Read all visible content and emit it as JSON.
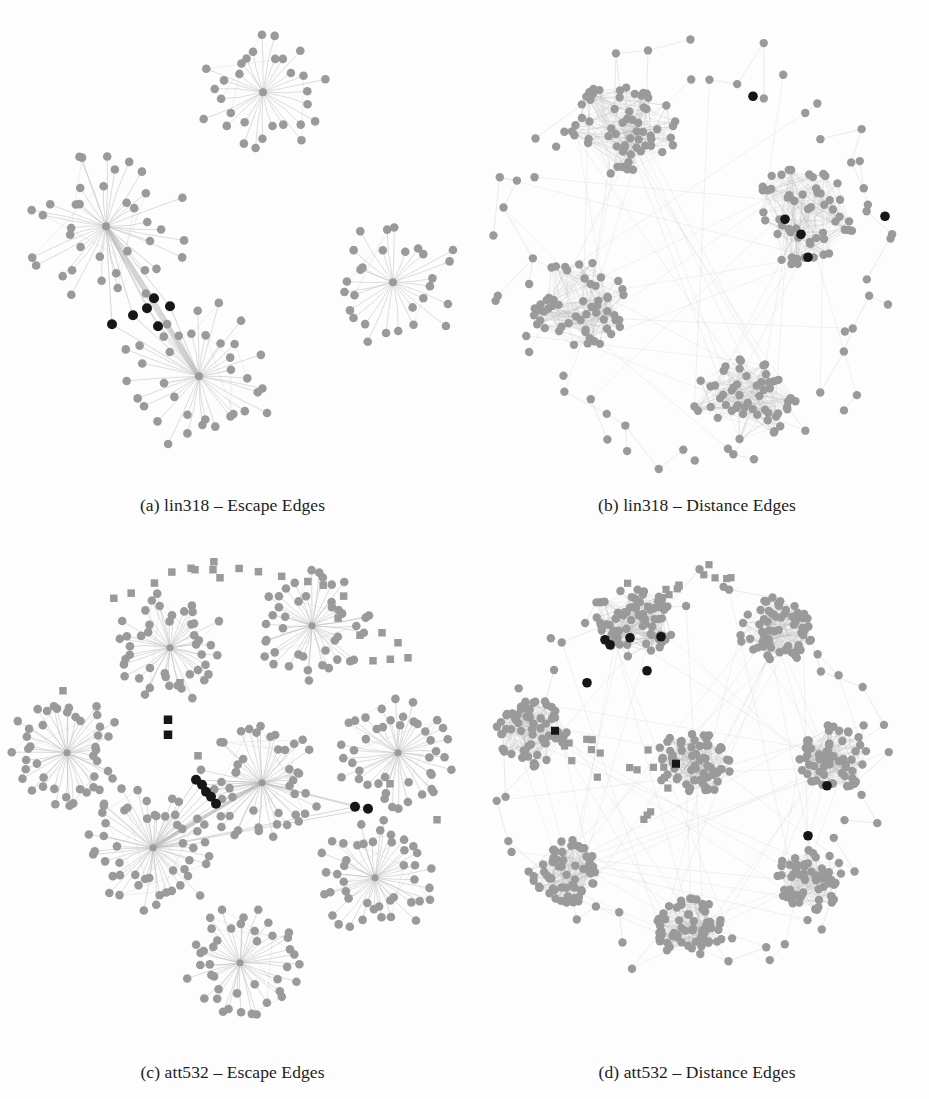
{
  "figure": {
    "background_color": "#fdfdfd",
    "node_color_gray": "#9a9a9a",
    "node_color_black": "#161616",
    "edge_color": "#b5b5b5",
    "caption_color": "#1c1c1c",
    "panel_count": 4
  },
  "panels": [
    {
      "id": "a",
      "caption": "(a) lin318 – Escape Edges",
      "instance": "lin318",
      "edge_type": "Escape Edges",
      "layout": "star-clusters",
      "cluster_count": 4,
      "gray_node_shape": "circle",
      "black_node_shape": "circle",
      "black_node_count": 6,
      "has_square_nodes": false
    },
    {
      "id": "b",
      "caption": "(b) lin318 – Distance Edges",
      "instance": "lin318",
      "edge_type": "Distance Edges",
      "layout": "blob-clusters",
      "cluster_count": 4,
      "gray_node_shape": "circle",
      "black_node_shape": "circle",
      "black_node_count": 5,
      "has_square_nodes": false
    },
    {
      "id": "c",
      "caption": "(c) att532 – Escape Edges",
      "instance": "att532",
      "edge_type": "Escape Edges",
      "layout": "star-clusters",
      "cluster_count": 8,
      "gray_node_shape": "circle",
      "black_node_shape": "circle",
      "black_node_count": 7,
      "has_square_nodes": true,
      "black_square_count": 2
    },
    {
      "id": "d",
      "caption": "(d) att532 – Distance Edges",
      "instance": "att532",
      "edge_type": "Distance Edges",
      "layout": "blob-clusters",
      "cluster_count": 8,
      "gray_node_shape": "circle",
      "black_node_shape": "circle",
      "black_node_count": 8,
      "has_square_nodes": true,
      "black_square_count": 2
    }
  ],
  "graph_spec": {
    "a": {
      "view": [
        0,
        0,
        465,
        488
      ],
      "seed": 17,
      "stars": [
        {
          "cx": 263,
          "cy": 88,
          "leaves": 30,
          "r1": 30,
          "r2": 70,
          "hubR": 4
        },
        {
          "cx": 106,
          "cy": 222,
          "leaves": 38,
          "r1": 32,
          "r2": 84,
          "hubR": 4
        },
        {
          "cx": 199,
          "cy": 372,
          "leaves": 36,
          "r1": 32,
          "r2": 80,
          "hubR": 4
        },
        {
          "cx": 393,
          "cy": 278,
          "leaves": 28,
          "r1": 30,
          "r2": 70,
          "hubR": 4
        }
      ],
      "bridge": {
        "from": 1,
        "to": 2
      },
      "black_nodes": [
        {
          "x": 154,
          "y": 294
        },
        {
          "x": 147,
          "y": 304
        },
        {
          "x": 170,
          "y": 302
        },
        {
          "x": 133,
          "y": 311
        },
        {
          "x": 112,
          "y": 320
        },
        {
          "x": 158,
          "y": 322
        }
      ],
      "squares": [],
      "black_squares": []
    },
    "b": {
      "view": [
        0,
        0,
        464,
        488
      ],
      "seed": 43,
      "blobs": [
        {
          "cx": 160,
          "cy": 122,
          "n": 58,
          "rx": 54,
          "ry": 50
        },
        {
          "cx": 340,
          "cy": 210,
          "n": 56,
          "rx": 50,
          "ry": 52
        },
        {
          "cx": 112,
          "cy": 300,
          "n": 54,
          "rx": 50,
          "ry": 46
        },
        {
          "cx": 280,
          "cy": 395,
          "n": 52,
          "rx": 52,
          "ry": 42
        }
      ],
      "periphery": 64,
      "ring_rx": 205,
      "ring_ry": 210,
      "ring_cx": 232,
      "ring_cy": 250,
      "black_nodes": [
        {
          "x": 288,
          "y": 92
        },
        {
          "x": 420,
          "y": 212
        },
        {
          "x": 320,
          "y": 215
        },
        {
          "x": 336,
          "y": 230
        },
        {
          "x": 343,
          "y": 253
        }
      ],
      "squares": [],
      "black_squares": []
    },
    "c": {
      "view": [
        0,
        0,
        465,
        500
      ],
      "seed": 91,
      "stars": [
        {
          "cx": 170,
          "cy": 100,
          "leaves": 44,
          "r1": 26,
          "r2": 62,
          "hubR": 3.5
        },
        {
          "cx": 312,
          "cy": 78,
          "leaves": 42,
          "r1": 26,
          "r2": 58,
          "hubR": 3.5
        },
        {
          "cx": 67,
          "cy": 205,
          "leaves": 44,
          "r1": 26,
          "r2": 60,
          "hubR": 3.5
        },
        {
          "cx": 153,
          "cy": 300,
          "leaves": 52,
          "r1": 28,
          "r2": 70,
          "hubR": 3.5
        },
        {
          "cx": 262,
          "cy": 235,
          "leaves": 46,
          "r1": 27,
          "r2": 64,
          "hubR": 3.5
        },
        {
          "cx": 398,
          "cy": 205,
          "leaves": 44,
          "r1": 27,
          "r2": 62,
          "hubR": 3.5
        },
        {
          "cx": 375,
          "cy": 330,
          "leaves": 44,
          "r1": 27,
          "r2": 62,
          "hubR": 3.5
        },
        {
          "cx": 240,
          "cy": 415,
          "leaves": 42,
          "r1": 26,
          "r2": 60,
          "hubR": 3.5
        }
      ],
      "bridge": {
        "from": 3,
        "to": 4
      },
      "black_nodes": [
        {
          "x": 193,
          "y": 789
        },
        {
          "x": 199,
          "y": 793
        },
        {
          "x": 203,
          "y": 800
        },
        {
          "x": 208,
          "y": 805
        },
        {
          "x": 213,
          "y": 812
        },
        {
          "x": 352,
          "y": 816
        },
        {
          "x": 365,
          "y": 818
        }
      ],
      "black_nodes_local": [
        {
          "x": 196,
          "y": 232
        },
        {
          "x": 202,
          "y": 237
        },
        {
          "x": 206,
          "y": 244
        },
        {
          "x": 211,
          "y": 249
        },
        {
          "x": 216,
          "y": 256
        },
        {
          "x": 355,
          "y": 259
        },
        {
          "x": 368,
          "y": 261
        }
      ],
      "black_squares": [
        {
          "x": 168,
          "y": 172
        },
        {
          "x": 168,
          "y": 187
        }
      ],
      "square_arcs": [
        {
          "cx": 232,
          "cy": 250,
          "r": 232,
          "a0": 238,
          "a1": 300,
          "n": 12,
          "jitter": 10
        },
        {
          "cx": 232,
          "cy": 250,
          "r": 210,
          "a0": 300,
          "a1": 318,
          "n": 3,
          "jitter": 9
        }
      ],
      "squares_extra": [
        {
          "x": 195,
          "y": 22
        },
        {
          "x": 220,
          "y": 30
        },
        {
          "x": 213,
          "y": 22
        },
        {
          "x": 382,
          "y": 85
        },
        {
          "x": 398,
          "y": 95
        },
        {
          "x": 408,
          "y": 110
        },
        {
          "x": 373,
          "y": 113
        },
        {
          "x": 437,
          "y": 272
        },
        {
          "x": 180,
          "y": 135
        },
        {
          "x": 63,
          "y": 143
        },
        {
          "x": 198,
          "y": 208
        },
        {
          "x": 390,
          "y": 236
        }
      ]
    },
    "d": {
      "view": [
        0,
        0,
        464,
        500
      ],
      "seed": 123,
      "blobs": [
        {
          "cx": 168,
          "cy": 75,
          "n": 66,
          "rx": 42,
          "ry": 34
        },
        {
          "cx": 310,
          "cy": 85,
          "n": 62,
          "rx": 36,
          "ry": 34
        },
        {
          "cx": 67,
          "cy": 185,
          "n": 62,
          "rx": 36,
          "ry": 34
        },
        {
          "cx": 228,
          "cy": 215,
          "n": 64,
          "rx": 38,
          "ry": 33
        },
        {
          "cx": 368,
          "cy": 210,
          "n": 60,
          "rx": 34,
          "ry": 36
        },
        {
          "cx": 98,
          "cy": 325,
          "n": 60,
          "rx": 36,
          "ry": 34
        },
        {
          "cx": 225,
          "cy": 380,
          "n": 60,
          "rx": 34,
          "ry": 32
        },
        {
          "cx": 345,
          "cy": 330,
          "n": 58,
          "rx": 34,
          "ry": 33
        }
      ],
      "periphery": 62,
      "ring_rx": 190,
      "ring_ry": 195,
      "ring_cx": 230,
      "ring_cy": 225,
      "black_nodes": [
        {
          "x": 140,
          "y": 92
        },
        {
          "x": 145,
          "y": 97
        },
        {
          "x": 165,
          "y": 90
        },
        {
          "x": 196,
          "y": 89
        },
        {
          "x": 182,
          "y": 123
        },
        {
          "x": 122,
          "y": 135
        },
        {
          "x": 362,
          "y": 238
        },
        {
          "x": 343,
          "y": 288
        }
      ],
      "black_squares": [
        {
          "x": 90,
          "y": 183
        },
        {
          "x": 211,
          "y": 216
        }
      ],
      "square_zones": [
        {
          "cx": 196,
          "cy": 40,
          "n": 10,
          "rx": 38,
          "ry": 22
        },
        {
          "cx": 248,
          "cy": 27,
          "n": 5,
          "rx": 20,
          "ry": 12
        },
        {
          "cx": 118,
          "cy": 205,
          "n": 8,
          "rx": 26,
          "ry": 30
        },
        {
          "cx": 181,
          "cy": 240,
          "n": 10,
          "rx": 22,
          "ry": 38
        }
      ]
    }
  }
}
